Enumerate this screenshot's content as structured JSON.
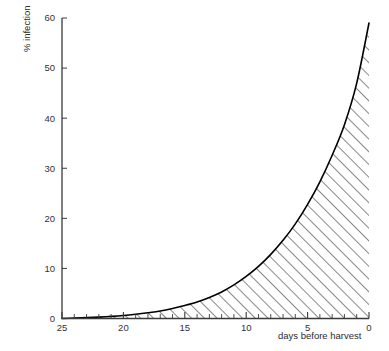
{
  "chart_data": {
    "type": "area",
    "title": "",
    "subtitle": "",
    "xlabel": "days before harvest",
    "ylabel": "% infection",
    "xlim": [
      25,
      0
    ],
    "ylim": [
      0,
      60
    ],
    "x_reversed": true,
    "grid": false,
    "legend": null,
    "legend_position": "none",
    "fill_style": "diagonal-hatch",
    "fill_color": "#000000",
    "line_color": "#000000",
    "x_ticks_major": [
      25,
      20,
      15,
      10,
      5,
      0
    ],
    "x_tick_labels": [
      "25",
      "20",
      "15",
      "10",
      "5",
      "0"
    ],
    "x_tick_minor_step": 1,
    "y_ticks_major": [
      0,
      10,
      20,
      30,
      40,
      50,
      60
    ],
    "y_tick_labels": [
      "0",
      "10",
      "20",
      "30",
      "40",
      "50",
      "60"
    ],
    "series": [
      {
        "name": "infection",
        "x": [
          25,
          24,
          23,
          22,
          21,
          20,
          19,
          18,
          17,
          16,
          15,
          14,
          13,
          12,
          11,
          10,
          9,
          8,
          7,
          6,
          5,
          4,
          3,
          2,
          1,
          0
        ],
        "values": [
          0.0,
          0.08,
          0.17,
          0.28,
          0.42,
          0.6,
          0.85,
          1.15,
          1.5,
          2.0,
          2.6,
          3.3,
          4.2,
          5.3,
          6.7,
          8.4,
          10.4,
          12.8,
          15.6,
          18.9,
          22.8,
          27.3,
          32.6,
          38.7,
          47.0,
          59.0
        ]
      }
    ],
    "annotations": []
  },
  "axis": {
    "y_label_text": "% infection",
    "x_label_text": "days before harvest"
  }
}
